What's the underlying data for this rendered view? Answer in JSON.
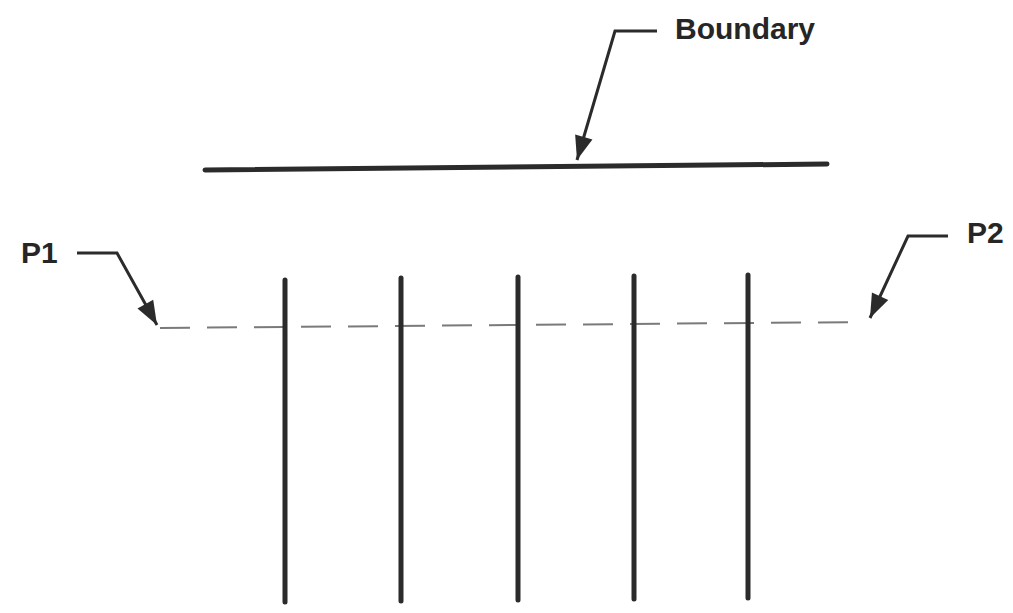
{
  "diagram": {
    "type": "schematic",
    "colors": {
      "stroke": "#2b2b2b",
      "dashed": "#7a7a7a",
      "text": "#262626",
      "background": "#ffffff"
    },
    "labels": {
      "boundary": "Boundary",
      "p1": "P1",
      "p2": "P2"
    },
    "boundary_line": {
      "x1": 205,
      "y1": 170,
      "x2": 827,
      "y2": 164
    },
    "profile_line": {
      "x1": 160,
      "y1": 328,
      "x2": 865,
      "y2": 322,
      "style": "dashed"
    },
    "vertical_lines": [
      {
        "id": "v1",
        "x": 285,
        "top": 280,
        "bottom": 602
      },
      {
        "id": "v2",
        "x": 401,
        "top": 278,
        "bottom": 601
      },
      {
        "id": "v3",
        "x": 518,
        "top": 277,
        "bottom": 600
      },
      {
        "id": "v4",
        "x": 634,
        "top": 276,
        "bottom": 599
      },
      {
        "id": "v5",
        "x": 748,
        "top": 275,
        "bottom": 598
      }
    ],
    "callouts": [
      {
        "id": "boundary-callout",
        "target": "Boundary",
        "points": [
          [
            657,
            31
          ],
          [
            615,
            31
          ],
          [
            577,
            160
          ]
        ]
      },
      {
        "id": "p1-callout",
        "target": "P1",
        "points": [
          [
            77,
            253
          ],
          [
            117,
            253
          ],
          [
            157,
            325
          ]
        ]
      },
      {
        "id": "p2-callout",
        "target": "P2",
        "points": [
          [
            948,
            236
          ],
          [
            908,
            236
          ],
          [
            870,
            318
          ]
        ]
      }
    ]
  }
}
